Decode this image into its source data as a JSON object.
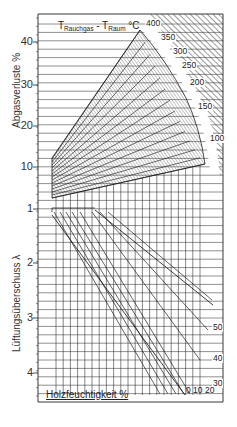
{
  "chart_data": {
    "type": "nomogram",
    "title_parts": {
      "t1": "T",
      "sub1": "Rauchgas",
      "sep": " - ",
      "t2": "T",
      "sub2": "Raum",
      "unit": " °C"
    },
    "upper_axis": {
      "label": "Abgasverluste %",
      "ticks": [
        {
          "value": "40",
          "y": 42
        },
        {
          "value": "30",
          "y": 85
        },
        {
          "value": "20",
          "y": 126
        },
        {
          "value": "10",
          "y": 167
        }
      ]
    },
    "lower_axis": {
      "label": "Lüftungsüberschuss λ",
      "ticks": [
        {
          "value": "1",
          "y": 209
        },
        {
          "value": "2",
          "y": 263
        },
        {
          "value": "3",
          "y": 318
        },
        {
          "value": "4",
          "y": 373
        }
      ]
    },
    "temperature_curve_labels": [
      "400",
      "350",
      "300",
      "250",
      "200",
      "150",
      "100"
    ],
    "co2_labels": [
      "50",
      "40",
      "30"
    ],
    "wood_moisture_label": "Holzfeuchtigkeit %",
    "wood_moisture_values": [
      "0",
      "10",
      "20"
    ],
    "frame": {
      "left": 38,
      "top": 14,
      "right": 223,
      "bottom": 402
    },
    "grid": true
  }
}
